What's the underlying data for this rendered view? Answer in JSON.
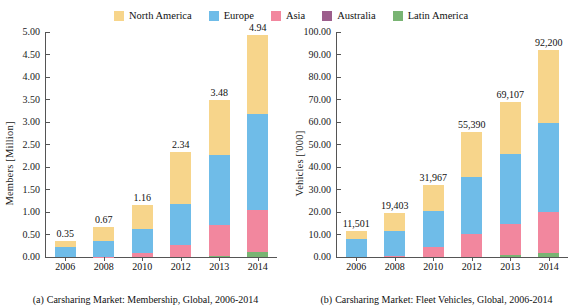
{
  "legend": {
    "position": "top-center",
    "items": [
      {
        "label": "North America",
        "color": "#F7D58B",
        "icon": "legend-swatch"
      },
      {
        "label": "Europe",
        "color": "#6FBCE8",
        "icon": "legend-swatch"
      },
      {
        "label": "Asia",
        "color": "#F2879E",
        "icon": "legend-swatch"
      },
      {
        "label": "Australia",
        "color": "#9C5E8C",
        "icon": "legend-swatch"
      },
      {
        "label": "Latin America",
        "color": "#79B473",
        "icon": "legend-swatch"
      }
    ]
  },
  "panels": [
    {
      "caption_label": "(a)",
      "caption_text": "Carsharing Market: Membership, Global, 2006-2014"
    },
    {
      "caption_label": "(b)",
      "caption_text": "Carsharing Market: Fleet Vehicles, Global, 2006-2014"
    }
  ],
  "chart_data": [
    {
      "type": "bar",
      "stacked": true,
      "title": "(a) Carsharing Market: Membership, Global, 2006-2014",
      "xlabel": "",
      "ylabel": "Members [Million]",
      "categories": [
        "2006",
        "2008",
        "2010",
        "2012",
        "2013",
        "2014"
      ],
      "ylim": [
        0,
        5.0
      ],
      "ytick_step": 0.5,
      "ytick_labels": [
        "0.00",
        "0.50",
        "1.00",
        "1.50",
        "2.00",
        "2.50",
        "3.00",
        "3.50",
        "4.00",
        "4.50",
        "5.00"
      ],
      "grid": false,
      "legend_position": "top-center",
      "series": [
        {
          "name": "Latin America",
          "color": "#79B473",
          "values": [
            0.0,
            0.0,
            0.0,
            0.0,
            0.03,
            0.12
          ]
        },
        {
          "name": "Australia",
          "color": "#9C5E8C",
          "values": [
            0.0,
            0.0,
            0.0,
            0.0,
            0.0,
            0.0
          ]
        },
        {
          "name": "Asia",
          "color": "#F2879E",
          "values": [
            0.0,
            0.01,
            0.09,
            0.27,
            0.69,
            0.93
          ]
        },
        {
          "name": "Europe",
          "color": "#6FBCE8",
          "values": [
            0.22,
            0.34,
            0.54,
            0.91,
            1.55,
            2.13
          ]
        },
        {
          "name": "North America",
          "color": "#F7D58B",
          "values": [
            0.13,
            0.32,
            0.53,
            1.16,
            1.21,
            1.76
          ]
        }
      ],
      "totals": [
        0.35,
        0.67,
        1.16,
        2.34,
        3.48,
        4.94
      ],
      "total_labels": [
        "0.35",
        "0.67",
        "1.16",
        "2.34",
        "3.48",
        "4.94"
      ]
    },
    {
      "type": "bar",
      "stacked": true,
      "title": "(b) Carsharing Market: Fleet Vehicles, Global, 2006-2014",
      "xlabel": "",
      "ylabel": "Vehicles ['000]",
      "categories": [
        "2006",
        "2008",
        "2010",
        "2012",
        "2013",
        "2014"
      ],
      "ylim": [
        0,
        100.0
      ],
      "ytick_step": 10,
      "ytick_labels": [
        "0.00",
        "10.00",
        "20.00",
        "30.00",
        "40.00",
        "50.00",
        "60.00",
        "70.00",
        "80.00",
        "90.00",
        "100.00"
      ],
      "grid": false,
      "legend_position": "top-center",
      "series": [
        {
          "name": "Latin America",
          "color": "#79B473",
          "values": [
            0.0,
            0.0,
            0.0,
            0.0,
            0.9,
            1.7
          ]
        },
        {
          "name": "Australia",
          "color": "#9C5E8C",
          "values": [
            0.0,
            0.0,
            0.0,
            0.0,
            0.0,
            0.0
          ]
        },
        {
          "name": "Asia",
          "color": "#F2879E",
          "values": [
            0.0,
            0.6,
            4.3,
            10.4,
            13.6,
            18.2
          ]
        },
        {
          "name": "Europe",
          "color": "#6FBCE8",
          "values": [
            7.8,
            10.8,
            16.3,
            25.2,
            31.3,
            39.5
          ]
        },
        {
          "name": "North America",
          "color": "#F7D58B",
          "values": [
            3.7,
            8.0,
            11.4,
            19.8,
            23.3,
            32.8
          ]
        }
      ],
      "totals": [
        11.501,
        19.403,
        31.967,
        55.39,
        69.107,
        92.2
      ],
      "total_labels": [
        "11,501",
        "19,403",
        "31,967",
        "55,390",
        "69,107",
        "92,200"
      ]
    }
  ]
}
